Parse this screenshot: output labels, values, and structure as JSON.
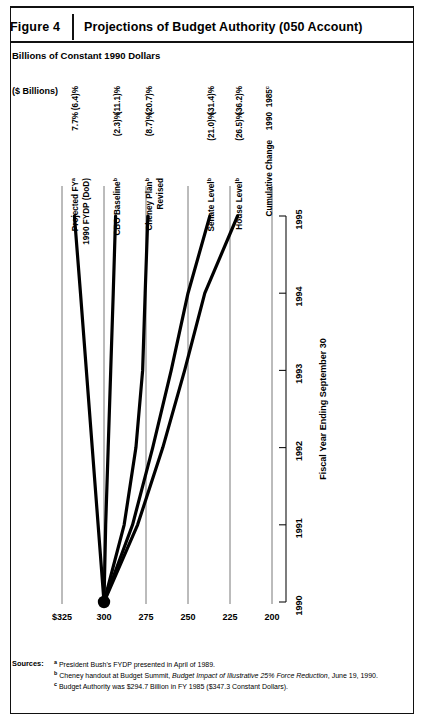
{
  "figure": {
    "number": "Figure 4",
    "title": "Projections of Budget Authority (050 Account)",
    "subtitle": "Billions of Constant 1990 Dollars"
  },
  "axis_unit_label": "($ Billions)",
  "sources": {
    "label": "Sources:",
    "notes": [
      {
        "mark": "a",
        "text": "President Bush's FYDP presented in April of 1989."
      },
      {
        "mark": "b",
        "pre": "Cheney handout at Budget Summit, ",
        "italic": "Budget Impact of Illustrative 25% Force Reduction",
        "post": ", June 19, 1990."
      },
      {
        "mark": "c",
        "text": "Budget Authority was $294.7 Billion in FY 1985 ($347.3 Constant Dollars)."
      }
    ]
  },
  "table": {
    "header_line1": "Cumulative Change",
    "header_col1": "1990",
    "header_col2": "1985",
    "header_col2_mark": "c"
  },
  "chart_data": {
    "type": "line",
    "title": "Projections of Budget Authority (050 Account)",
    "xlabel": "Fiscal Year Ending September 30",
    "ylabel": "($ Billions)",
    "x": [
      1990,
      1991,
      1992,
      1993,
      1994,
      1995
    ],
    "xtick_labels": [
      "1990",
      "1991",
      "1992",
      "1993",
      "1994",
      "1995"
    ],
    "ytick_labels": [
      "$325",
      "300",
      "275",
      "250",
      "225",
      "200"
    ],
    "ytick_values": [
      325,
      300,
      275,
      250,
      225,
      200
    ],
    "ylim": [
      200,
      325
    ],
    "xlim": [
      1990,
      1995
    ],
    "grid": false,
    "legend": "inline-right-endpoint-labels",
    "series": [
      {
        "name": "Projected FY 1990 FYDP (DoD)",
        "label_line1": "Projected FY",
        "label_line1_mark": "a",
        "label_line2": "1990 FYDP (DoD)",
        "label_line2_mark": "",
        "values": [
          300.0,
          303.5,
          307.0,
          310.5,
          314.0,
          317.6
        ],
        "change_1990": "7.7%",
        "change_1985": "(6.4)%"
      },
      {
        "name": "CBO Baseline",
        "label_line1": "CBO Baseline",
        "label_line1_mark": "b",
        "label_line2": "",
        "label_line2_mark": "",
        "values": [
          300.0,
          299.0,
          297.5,
          296.0,
          294.5,
          293.1
        ],
        "change_1990": "(2.3)%",
        "change_1985": "(11.1)%"
      },
      {
        "name": "Cheney Plan Revised",
        "label_line1": "Cheney Plan",
        "label_line1_mark": "b",
        "label_line2": "Revised",
        "label_line2_mark": "",
        "values": [
          300.0,
          288.0,
          281.0,
          277.0,
          275.5,
          273.9
        ],
        "change_1990": "(8.7)%",
        "change_1985": "(20.7)%"
      },
      {
        "name": "Senate Level",
        "label_line1": "Senate Level",
        "label_line1_mark": "b",
        "label_line2": "",
        "label_line2_mark": "",
        "values": [
          300.0,
          283.0,
          271.0,
          260.0,
          250.0,
          237.0
        ],
        "change_1990": "(21.0)%",
        "change_1985": "(31.4)%"
      },
      {
        "name": "House Level",
        "label_line1": "House Level",
        "label_line1_mark": "b",
        "label_line2": "",
        "label_line2_mark": "",
        "values": [
          300.0,
          280.0,
          265.0,
          252.0,
          240.0,
          220.5
        ],
        "change_1990": "(26.5)%",
        "change_1985": "(36.2)%"
      }
    ]
  }
}
